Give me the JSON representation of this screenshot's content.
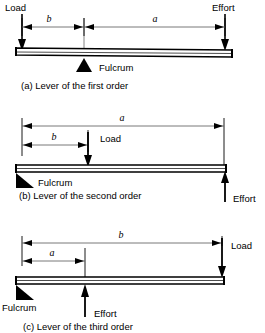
{
  "figure": {
    "background_color": "#ffffff",
    "ink_color": "#000000",
    "dimension_line_color": "#555555",
    "diagrams": [
      {
        "id": "lever-first-order",
        "caption": "(a) Lever of the first order",
        "order": "first",
        "fulcrum_label": "Fulcrum",
        "fulcrum_position": "middle",
        "fulcrum_shape": "isosceles-triangle",
        "load": {
          "label": "Load",
          "direction": "down",
          "position": "left-end"
        },
        "effort": {
          "label": "Effort",
          "direction": "down",
          "position": "right-end"
        },
        "dimensions": [
          {
            "label": "b",
            "from": "load",
            "to": "fulcrum"
          },
          {
            "label": "a",
            "from": "fulcrum",
            "to": "effort"
          }
        ]
      },
      {
        "id": "lever-second-order",
        "caption": "(b) Lever of the second order",
        "order": "second",
        "fulcrum_label": "Fulcrum",
        "fulcrum_position": "left-end",
        "fulcrum_shape": "right-triangle",
        "load": {
          "label": "Load",
          "direction": "down",
          "position": "middle"
        },
        "effort": {
          "label": "Effort",
          "direction": "up",
          "position": "right-end"
        },
        "dimensions": [
          {
            "label": "a",
            "from": "fulcrum",
            "to": "effort"
          },
          {
            "label": "b",
            "from": "fulcrum",
            "to": "load"
          }
        ]
      },
      {
        "id": "lever-third-order",
        "caption": "(c) Lever of the third order",
        "order": "third",
        "fulcrum_label": "Fulcrum",
        "fulcrum_position": "left-end",
        "fulcrum_shape": "right-triangle",
        "load": {
          "label": "Load",
          "direction": "down",
          "position": "right-end"
        },
        "effort": {
          "label": "Effort",
          "direction": "up",
          "position": "middle-left"
        },
        "dimensions": [
          {
            "label": "b",
            "from": "fulcrum",
            "to": "load"
          },
          {
            "label": "a",
            "from": "fulcrum",
            "to": "effort"
          }
        ]
      }
    ]
  }
}
